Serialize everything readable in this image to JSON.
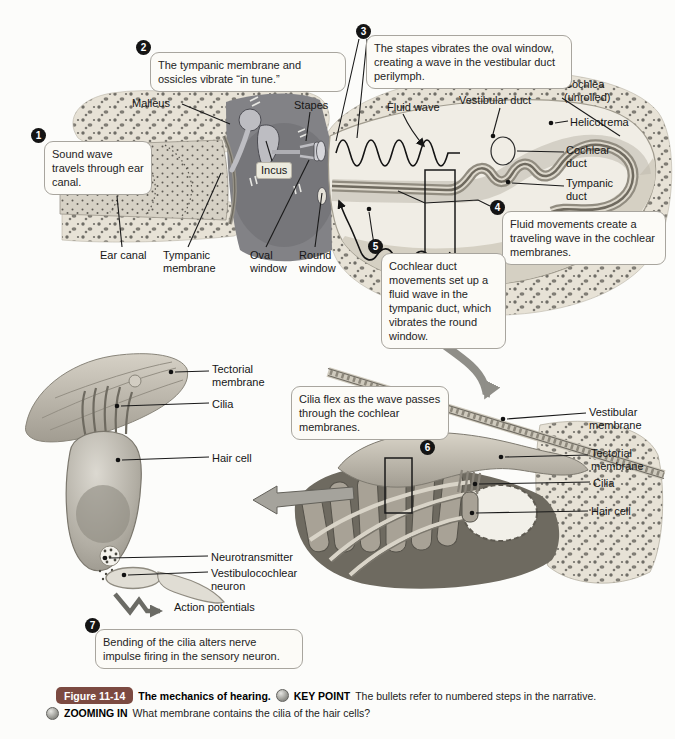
{
  "steps": [
    {
      "num": "1",
      "text": "Sound wave travels through ear canal."
    },
    {
      "num": "2",
      "text": "The tympanic membrane and ossicles vibrate “in tune.”"
    },
    {
      "num": "3",
      "text": "The stapes vibrates the oval window, creating a wave in the vestibular duct perilymph."
    },
    {
      "num": "4",
      "text": "Fluid movements create a traveling wave in the cochlear membranes."
    },
    {
      "num": "5",
      "text": "Cochlear duct movements set up a fluid wave in the tympanic duct, which vibrates the round window."
    },
    {
      "num": "6",
      "text": "Cilia flex as the wave passes through the cochlear membranes."
    },
    {
      "num": "7",
      "text": "Bending of the cilia alters nerve impulse firing in the sensory neuron."
    }
  ],
  "labels": {
    "malleus": "Malleus",
    "stapes": "Stapes",
    "incus": "Incus",
    "fluid_wave": "Fluid wave",
    "vestibular_duct": "Vestibular duct",
    "cochlea_unrolled": "Cochlea\n(unrolled)",
    "helicotrema": "Helicotrema",
    "cochlear_duct": "Cochlear\nduct",
    "tympanic_duct": "Tympanic\nduct",
    "ear_canal": "Ear canal",
    "tympanic_membrane": "Tympanic\nmembrane",
    "oval_window": "Oval\nwindow",
    "round_window": "Round\nwindow",
    "tectorial_membrane": "Tectorial\nmembrane",
    "cilia": "Cilia",
    "hair_cell": "Hair cell",
    "vestibular_membrane": "Vestibular\nmembrane",
    "neurotransmitter": "Neurotransmitter",
    "vestibulocochlear_neuron": "Vestibulocochlear\nneuron",
    "action_potentials": "Action potentials"
  },
  "caption": {
    "figure_badge": "Figure 11-14",
    "title": "The mechanics of hearing.",
    "key_point_label": "KEY POINT",
    "key_point_text": "The bullets refer to numbered steps in the narrative.",
    "zooming_in_label": "ZOOMING IN",
    "zooming_in_text": "What membrane contains the cilia of the hair cells?"
  },
  "colors": {
    "page_bg": "#fcfcfa",
    "figure_badge_bg": "#7c4a41",
    "callout_border": "#a8a59e",
    "badge_bg": "#141414"
  }
}
